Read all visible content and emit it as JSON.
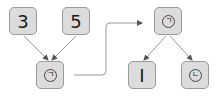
{
  "colors": {
    "node_fill": "#dcdcdc",
    "node_border": "#9a9a9a",
    "edge": "#888888"
  },
  "left_tree": {
    "leaf_left": {
      "label": "3"
    },
    "leaf_right": {
      "label": "5"
    },
    "root": {
      "label": "ㄱ",
      "icon": "circled-hangul-giyeok-icon"
    }
  },
  "right_tree": {
    "root": {
      "label": "ㄱ",
      "icon": "circled-hangul-giyeok-icon"
    },
    "child_left": {
      "label": "I"
    },
    "child_right": {
      "label": "ㄴ",
      "icon": "circled-hangul-nieun-icon"
    }
  },
  "transform_arrow": {
    "icon": "arrow-right-icon"
  }
}
